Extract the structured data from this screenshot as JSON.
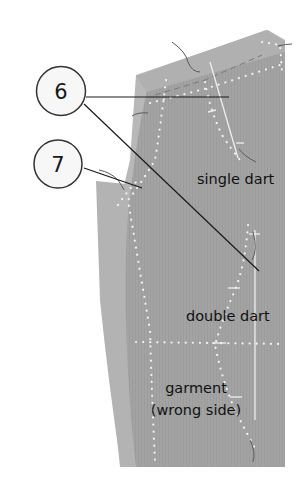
{
  "diagram": {
    "colors": {
      "background": "#ffffff",
      "fabric_main": "#a3a3a3",
      "fabric_back": "#b5b5b5",
      "fabric_edge": "#c4c4c4",
      "stitch_dots": "#f2f2f2",
      "leader_line": "#1a1a1a",
      "thread": "#555555",
      "callout_fill": "#f7f7f7"
    },
    "callouts": [
      {
        "id": "6",
        "label": "6"
      },
      {
        "id": "7",
        "label": "7"
      }
    ],
    "labels": {
      "single_dart": "single dart",
      "double_dart": "double dart",
      "garment_line1": "garment",
      "garment_line2": "(wrong side)"
    }
  }
}
